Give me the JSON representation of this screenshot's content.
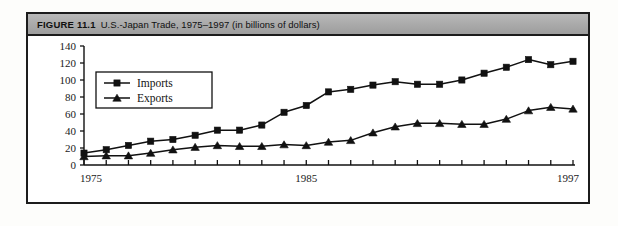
{
  "figure": {
    "label": "FIGURE 11.1",
    "title": "U.S.-Japan Trade, 1975–1997 (in billions of dollars)"
  },
  "axis": {
    "y_ticks": [
      "0",
      "20",
      "40",
      "60",
      "80",
      "100",
      "120",
      "140"
    ],
    "x_tick_labels": [
      "1975",
      "1985",
      "1997"
    ]
  },
  "legend": {
    "imports_label": "Imports",
    "exports_label": "Exports"
  },
  "colors": {
    "line": "#111111",
    "marker": "#111111",
    "frame": "#1c1c1c",
    "titlebar": "#ababab",
    "plot_background": "#ffffff"
  },
  "chart_data": {
    "type": "line",
    "title": "U.S.-Japan Trade, 1975–1997 (in billions of dollars)",
    "xlabel": "",
    "ylabel": "",
    "ylim": [
      0,
      140
    ],
    "grid": false,
    "legend_position": "upper-left-inside",
    "x": [
      1975,
      1976,
      1977,
      1978,
      1979,
      1980,
      1981,
      1982,
      1983,
      1984,
      1985,
      1986,
      1987,
      1988,
      1989,
      1990,
      1991,
      1992,
      1993,
      1994,
      1995,
      1996,
      1997
    ],
    "categories": [
      "1975",
      "1976",
      "1977",
      "1978",
      "1979",
      "1980",
      "1981",
      "1982",
      "1983",
      "1984",
      "1985",
      "1986",
      "1987",
      "1988",
      "1989",
      "1990",
      "1991",
      "1992",
      "1993",
      "1994",
      "1995",
      "1996",
      "1997"
    ],
    "series": [
      {
        "name": "Imports",
        "marker": "square",
        "values": [
          14,
          18,
          23,
          28,
          30,
          35,
          41,
          41,
          47,
          62,
          70,
          86,
          89,
          94,
          98,
          95,
          95,
          100,
          108,
          115,
          124,
          118,
          122
        ]
      },
      {
        "name": "Exports",
        "marker": "triangle",
        "values": [
          10,
          11,
          11,
          14,
          18,
          21,
          23,
          22,
          22,
          24,
          23,
          27,
          29,
          38,
          45,
          49,
          49,
          48,
          48,
          54,
          64,
          68,
          66
        ]
      }
    ]
  }
}
